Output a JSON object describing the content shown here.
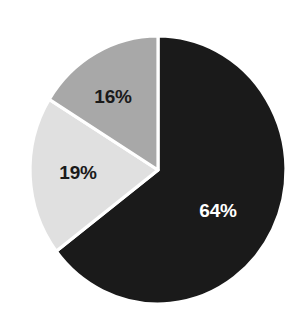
{
  "chart_data": {
    "type": "pie",
    "title": "",
    "subtitle": "",
    "xlabel": "",
    "ylabel": "",
    "grid": false,
    "legend": "none",
    "start_angle_deg": 0,
    "direction": "clockwise",
    "categories": [
      "64%",
      "19%",
      "16%"
    ],
    "values": [
      64,
      19,
      16
    ],
    "total": 99,
    "slices": [
      {
        "label": "64%",
        "value": 64,
        "color": "#1a1a1a",
        "label_color": "#ffffff",
        "start_deg": 0,
        "end_deg": 232.7,
        "label_x": 218,
        "label_y": 210
      },
      {
        "label": "19%",
        "value": 19,
        "color": "#e0e0e0",
        "label_color": "#1a1a1a",
        "start_deg": 232.7,
        "end_deg": 301.8,
        "label_x": 78,
        "label_y": 172
      },
      {
        "label": "16%",
        "value": 16,
        "color": "#a8a8a8",
        "label_color": "#1a1a1a",
        "start_deg": 301.8,
        "end_deg": 360,
        "label_x": 113,
        "label_y": 96
      }
    ],
    "geometry": {
      "center_x": 158,
      "center_y": 170,
      "radius_x": 128,
      "radius_y": 134,
      "separator_color": "#ffffff",
      "separator_width": 3.2
    },
    "background": "#ffffff"
  }
}
